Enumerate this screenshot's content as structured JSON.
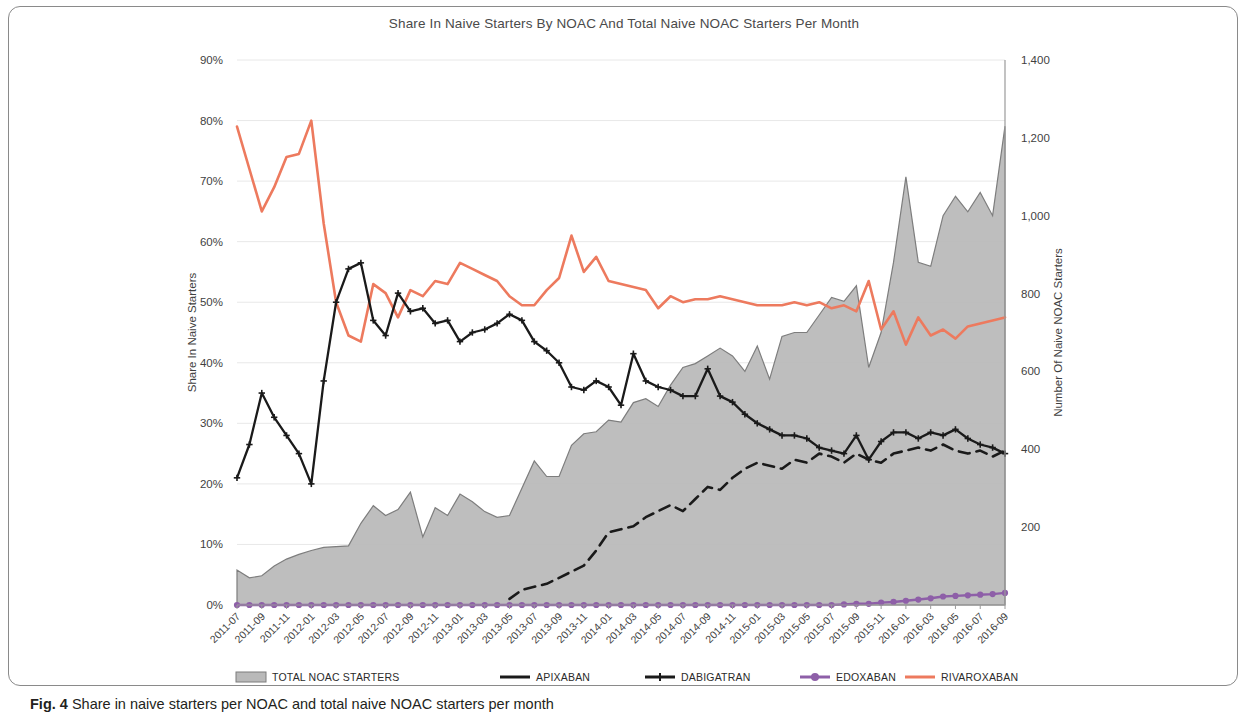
{
  "figure": {
    "caption_label": "Fig. 4",
    "caption_text": "Share in naive starters per NOAC and total naive NOAC starters per month"
  },
  "colors": {
    "rivaroxaban": "#ED7A5E",
    "edoxaban": "#8E5FA8",
    "apixaban": "#1a1a1a",
    "dabigatran": "#1a1a1a",
    "total_area_fill": "#b9b9b9",
    "total_area_stroke": "#7d7d7d",
    "grid": "#e8e8e8",
    "axis": "#9a9a9a",
    "text": "#3f3f3f",
    "frame": "#8a8a8a"
  },
  "chart_data": {
    "type": "line",
    "title": "Share In Naive Starters By NOAC And Total Naive NOAC Starters Per Month",
    "xlabel": "",
    "ylabel": "Share In Naive Starters",
    "y2label": "Number Of Naive NOAC Starters",
    "ylim": [
      0,
      90
    ],
    "y2lim": [
      0,
      1400
    ],
    "ytick_labels": [
      "0%",
      "10%",
      "20%",
      "30%",
      "40%",
      "50%",
      "60%",
      "70%",
      "80%",
      "90%"
    ],
    "ytick_values": [
      0,
      10,
      20,
      30,
      40,
      50,
      60,
      70,
      80,
      90
    ],
    "y2tick_labels": [
      "200",
      "400",
      "600",
      "800",
      "1,000",
      "1,200",
      "1,400"
    ],
    "y2tick_values": [
      200,
      400,
      600,
      800,
      1000,
      1200,
      1400
    ],
    "grid": true,
    "legend_position": "bottom",
    "x": [
      "2011-07",
      "2011-08",
      "2011-09",
      "2011-10",
      "2011-11",
      "2011-12",
      "2012-01",
      "2012-02",
      "2012-03",
      "2012-04",
      "2012-05",
      "2012-06",
      "2012-07",
      "2012-08",
      "2012-09",
      "2012-10",
      "2012-11",
      "2012-12",
      "2013-01",
      "2013-02",
      "2013-03",
      "2013-04",
      "2013-05",
      "2013-06",
      "2013-07",
      "2013-08",
      "2013-09",
      "2013-10",
      "2013-11",
      "2013-12",
      "2014-01",
      "2014-02",
      "2014-03",
      "2014-04",
      "2014-05",
      "2014-06",
      "2014-07",
      "2014-08",
      "2014-09",
      "2014-10",
      "2014-11",
      "2014-12",
      "2015-01",
      "2015-02",
      "2015-03",
      "2015-04",
      "2015-05",
      "2015-06",
      "2015-07",
      "2015-08",
      "2015-09",
      "2015-10",
      "2015-11",
      "2015-12",
      "2016-01",
      "2016-02",
      "2016-03",
      "2016-04",
      "2016-05",
      "2016-06",
      "2016-07",
      "2016-08",
      "2016-09"
    ],
    "xtick_labels": [
      "2011-07",
      "2011-09",
      "2011-11",
      "2012-01",
      "2012-03",
      "2012-05",
      "2012-07",
      "2012-09",
      "2012-11",
      "2013-01",
      "2013-03",
      "2013-05",
      "2013-07",
      "2013-09",
      "2013-11",
      "2014-01",
      "2014-03",
      "2014-05",
      "2014-07",
      "2014-09",
      "2014-11",
      "2015-01",
      "2015-03",
      "2015-05",
      "2015-07",
      "2015-09",
      "2015-11",
      "2016-01",
      "2016-03",
      "2016-05",
      "2016-07",
      "2016-09"
    ],
    "series": [
      {
        "name": "TOTAL NOAC STARTERS",
        "axis": "right",
        "style": "area",
        "values": [
          90,
          70,
          75,
          100,
          118,
          130,
          140,
          148,
          150,
          152,
          210,
          255,
          230,
          245,
          290,
          175,
          250,
          230,
          285,
          265,
          240,
          225,
          230,
          300,
          370,
          330,
          330,
          410,
          440,
          445,
          475,
          470,
          520,
          530,
          510,
          565,
          610,
          620,
          640,
          660,
          640,
          600,
          665,
          580,
          690,
          700,
          700,
          745,
          790,
          780,
          820,
          610,
          700,
          880,
          1100,
          880,
          870,
          1000,
          1050,
          1010,
          1060,
          1000,
          1230
        ]
      },
      {
        "name": "APIXABAN",
        "axis": "left",
        "style": "dashed",
        "values": [
          null,
          null,
          null,
          null,
          null,
          null,
          null,
          null,
          null,
          null,
          null,
          null,
          null,
          null,
          null,
          null,
          null,
          null,
          null,
          null,
          null,
          null,
          1.0,
          2.5,
          3.0,
          3.5,
          4.5,
          5.5,
          6.5,
          9.0,
          12.0,
          12.5,
          13.0,
          14.5,
          15.5,
          16.5,
          15.5,
          17.5,
          19.5,
          19.0,
          21.0,
          22.5,
          23.5,
          23.0,
          22.5,
          24.0,
          23.5,
          25.0,
          24.5,
          23.5,
          25.0,
          24.0,
          23.5,
          25.0,
          25.5,
          26.0,
          25.5,
          26.5,
          25.5,
          25.0,
          25.5,
          24.5,
          25.5
        ]
      },
      {
        "name": "DABIGATRAN",
        "axis": "left",
        "style": "marker",
        "values": [
          21.0,
          26.5,
          35.0,
          31.0,
          28.0,
          25.0,
          20.0,
          37.0,
          50.0,
          55.5,
          56.5,
          47.0,
          44.5,
          51.5,
          48.5,
          49.0,
          46.5,
          47.0,
          43.5,
          45.0,
          45.5,
          46.5,
          48.0,
          47.0,
          43.5,
          42.0,
          40.0,
          36.0,
          35.5,
          37.0,
          36.0,
          33.0,
          41.5,
          37.0,
          36.0,
          35.5,
          34.5,
          34.5,
          39.0,
          34.5,
          33.5,
          31.5,
          30.0,
          29.0,
          28.0,
          28.0,
          27.5,
          26.0,
          25.5,
          25.0,
          28.0,
          24.0,
          27.0,
          28.5,
          28.5,
          27.5,
          28.5,
          28.0,
          29.0,
          27.5,
          26.5,
          26.0,
          25.0
        ]
      },
      {
        "name": "EDOXABAN",
        "axis": "left",
        "style": "marker",
        "values": [
          0,
          0,
          0,
          0,
          0,
          0,
          0,
          0,
          0,
          0,
          0,
          0,
          0,
          0,
          0,
          0,
          0,
          0,
          0,
          0,
          0,
          0,
          0,
          0,
          0,
          0,
          0,
          0,
          0,
          0,
          0,
          0,
          0,
          0,
          0,
          0,
          0,
          0,
          0,
          0,
          0,
          0,
          0,
          0,
          0,
          0,
          0,
          0,
          0,
          0.1,
          0.2,
          0.2,
          0.4,
          0.5,
          0.7,
          0.9,
          1.1,
          1.4,
          1.5,
          1.6,
          1.7,
          1.8,
          2.0
        ]
      },
      {
        "name": "RIVAROXABAN",
        "axis": "left",
        "style": "line",
        "values": [
          79.0,
          72.0,
          65.0,
          69.0,
          74.0,
          74.5,
          80.0,
          63.0,
          50.0,
          44.5,
          43.5,
          53.0,
          51.5,
          47.5,
          52.0,
          51.0,
          53.5,
          53.0,
          56.5,
          55.5,
          54.5,
          53.5,
          51.0,
          49.5,
          49.5,
          52.0,
          54.0,
          61.0,
          55.0,
          57.5,
          53.5,
          53.0,
          52.5,
          52.0,
          49.0,
          51.0,
          50.0,
          50.5,
          50.5,
          51.0,
          50.5,
          50.0,
          49.5,
          49.5,
          49.5,
          50.0,
          49.5,
          50.0,
          49.0,
          49.5,
          48.5,
          53.5,
          45.5,
          48.5,
          43.0,
          47.5,
          44.5,
          45.5,
          44.0,
          46.0,
          46.5,
          47.0,
          47.5
        ]
      }
    ],
    "legend": [
      {
        "label": "TOTAL NOAC STARTERS",
        "marker": "area-swatch",
        "color": "#b9b9b9"
      },
      {
        "label": "APIXABAN",
        "marker": "line-solid",
        "color": "#1a1a1a"
      },
      {
        "label": "DABIGATRAN",
        "marker": "line-cross",
        "color": "#1a1a1a"
      },
      {
        "label": "EDOXABAN",
        "marker": "line-dot",
        "color": "#8E5FA8"
      },
      {
        "label": "RIVAROXABAN",
        "marker": "line-solid",
        "color": "#ED7A5E"
      }
    ]
  }
}
